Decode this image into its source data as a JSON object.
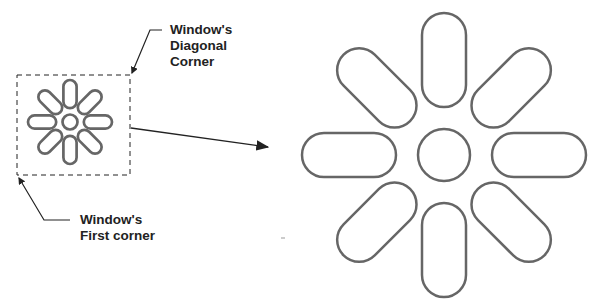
{
  "labels": {
    "diagonal_corner": [
      "Window's",
      "Diagonal",
      "Corner"
    ],
    "first_corner": [
      "Window's",
      "First corner"
    ]
  },
  "colors": {
    "shape_stroke": "#666666",
    "annotation": "#222222"
  }
}
